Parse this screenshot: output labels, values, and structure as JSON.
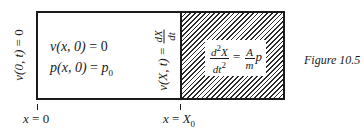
{
  "figure": {
    "caption": "Figure 10.5",
    "regions": {
      "left": {
        "fill": "#ffffff",
        "initial_conditions": [
          {
            "lhs": "v(x, 0)",
            "rhs": "0"
          },
          {
            "lhs": "p(x, 0)",
            "rhs": "p",
            "rhs_sub": "0"
          }
        ]
      },
      "right": {
        "fill": "hatched",
        "equation": {
          "lhs_num": "d",
          "lhs_num_sup": "2",
          "lhs_num_tail": "X",
          "lhs_den": "dt",
          "lhs_den_sup": "2",
          "rhs_num": "A",
          "rhs_den": "m",
          "rhs_tail": "p"
        }
      }
    },
    "boundary_conditions": {
      "left": {
        "lhs": "v(0, t)",
        "rhs": "0"
      },
      "right": {
        "lhs": "v(X, t)",
        "rhs_num": "dX",
        "rhs_den": "dt"
      }
    },
    "x_axis": {
      "ticks": [
        {
          "var": "x",
          "value": "0",
          "value_sub": ""
        },
        {
          "var": "x",
          "value": "X",
          "value_sub": "0"
        }
      ]
    },
    "colors": {
      "ink": "#1a1a1a",
      "background": "#ffffff"
    }
  }
}
